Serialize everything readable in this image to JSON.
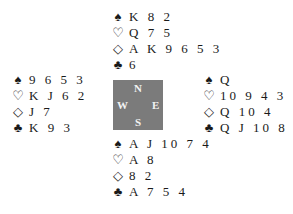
{
  "suits": {
    "spades": "♠",
    "hearts": "♡",
    "diamonds": "◇",
    "clubs": "♣"
  },
  "hands": {
    "north": {
      "spades": "K 8 2",
      "hearts": "Q 7 5",
      "diamonds": "A K 9 6 5 3",
      "clubs": "6"
    },
    "west": {
      "spades": "9 6 5 3",
      "hearts": "K J 6 2",
      "diamonds": "J 7",
      "clubs": "K 9 3"
    },
    "east": {
      "spades": "Q",
      "hearts": "10 9 4 3",
      "diamonds": "Q 10 4",
      "clubs": "Q J 10 8 2"
    },
    "south": {
      "spades": "A J 10 7 4",
      "hearts": "A 8",
      "diamonds": "8 2",
      "clubs": "A 7 5 4"
    }
  },
  "compass": {
    "n": "N",
    "s": "S",
    "w": "W",
    "e": "E",
    "color": "#7b7b7b"
  }
}
